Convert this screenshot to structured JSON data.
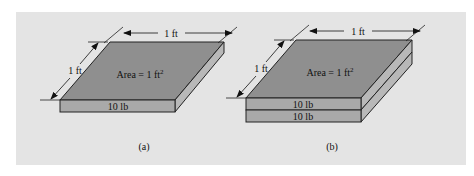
{
  "figure": {
    "panel_color": "#e4e4e4",
    "face_top_color": "#8f8f8f",
    "face_front_color": "#a9a9a9",
    "face_side_color": "#b8b8b8",
    "a": {
      "caption": "(a)",
      "width_label": "1 ft",
      "depth_label": "1 ft",
      "area_label": "Area = 1 ft",
      "area_exp": "2",
      "slabs": [
        "10 lb"
      ]
    },
    "b": {
      "caption": "(b)",
      "width_label": "1 ft",
      "depth_label": "1 ft",
      "area_label": "Area = 1 ft",
      "area_exp": "2",
      "slabs": [
        "10 lb",
        "10 lb"
      ]
    }
  }
}
